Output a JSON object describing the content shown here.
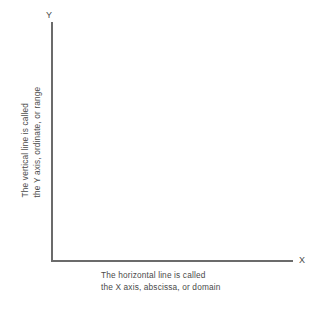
{
  "diagram": {
    "background_color": "#ffffff",
    "axis_color": "#6b6b6b",
    "text_color": "#4a4a4a",
    "y_axis": {
      "letter": "Y",
      "caption_line_1": "The vertical line is called",
      "caption_line_2": "the Y axis, ordinate, or range"
    },
    "x_axis": {
      "letter": "X",
      "caption_line_1": "The horizontal line is called",
      "caption_line_2": "the X axis, abscissa, or domain"
    }
  }
}
